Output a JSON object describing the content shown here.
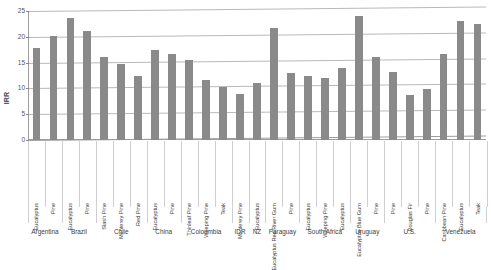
{
  "chart_data": {
    "type": "bar",
    "title": "",
    "xlabel": "",
    "ylabel": "IRR",
    "ylim": [
      0,
      25
    ],
    "yticks": [
      0,
      5,
      10,
      15,
      20,
      25
    ],
    "grid": true,
    "legend": "none",
    "bar_color": "#8a8a8a",
    "categories": [
      "Eucalyptus",
      "Pine",
      "Eucalyptus",
      "Pine",
      "Slash Pine",
      "Monterey Pine",
      "Red Pine",
      "Eucalyptus",
      "Pine",
      "Thinleaf Pine",
      "Weeping Pine",
      "Teak",
      "Monterey Pine",
      "Eucalyptus",
      "Eucalyptus Red River Gum",
      "Pine",
      "Eucalyptus",
      "Weeping Pine",
      "Eucalyptus",
      "Eucalyptus Blue Gum",
      "Pine",
      "Pine",
      "Douglas Fir",
      "Pine",
      "Caribbean Pine",
      "Eucalyptus",
      "Teak"
    ],
    "values": [
      17.9,
      20.1,
      23.6,
      21.2,
      16.1,
      14.8,
      12.4,
      17.5,
      16.6,
      15.6,
      11.7,
      10.2,
      9.0,
      11.0,
      21.8,
      13.0,
      12.5,
      12.0,
      14.0,
      24.1,
      16.0,
      13.1,
      8.8,
      9.8,
      16.7,
      23.0,
      22.4
    ],
    "groups": [
      {
        "label": "Argentina",
        "start": 0,
        "count": 2
      },
      {
        "label": "Brazil",
        "start": 2,
        "count": 2
      },
      {
        "label": "Chile",
        "start": 4,
        "count": 3
      },
      {
        "label": "China",
        "start": 7,
        "count": 2
      },
      {
        "label": "Coloumbia",
        "start": 9,
        "count": 3
      },
      {
        "label": "IDR",
        "start": 12,
        "count": 1
      },
      {
        "label": "NZ",
        "start": 13,
        "count": 1
      },
      {
        "label": "Paraguay",
        "start": 14,
        "count": 2
      },
      {
        "label": "South Africa",
        "start": 16,
        "count": 3
      },
      {
        "label": "Uruguay",
        "start": 19,
        "count": 2
      },
      {
        "label": "U.S.",
        "start": 21,
        "count": 3
      },
      {
        "label": "Venezuela",
        "start": 24,
        "count": 3
      }
    ]
  }
}
